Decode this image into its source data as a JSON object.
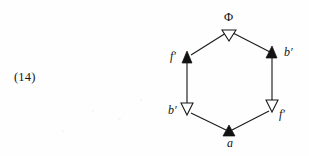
{
  "figure": {
    "kind": "commutative-hexagon-diagram",
    "equation_number": "(14)",
    "background_color": "#fefefe",
    "ink_color": "#121212",
    "vertices": [
      {
        "id": "top",
        "label": "Φ",
        "style": "upright",
        "x": 229,
        "y": 30,
        "label_x": 224,
        "label_y": 11
      },
      {
        "id": "upper-left",
        "label": "f′",
        "style": "italic",
        "x": 187,
        "y": 57,
        "label_x": 170,
        "label_y": 50
      },
      {
        "id": "upper-right",
        "label": "b′",
        "style": "italic",
        "x": 272,
        "y": 53,
        "label_x": 284,
        "label_y": 46
      },
      {
        "id": "lower-left",
        "label": "b′",
        "style": "italic",
        "x": 187,
        "y": 110,
        "label_x": 168,
        "label_y": 104
      },
      {
        "id": "lower-right",
        "label": "f′",
        "style": "italic",
        "x": 272,
        "y": 107,
        "label_x": 279,
        "label_y": 108
      },
      {
        "id": "bottom",
        "label": "a",
        "style": "italic",
        "x": 229,
        "y": 132,
        "label_x": 227,
        "label_y": 137
      }
    ],
    "arrowheads": [
      {
        "id": "arrow-to-phi-top",
        "fill": "hollow",
        "at": "top",
        "direction": "up"
      },
      {
        "id": "arrow-to-upper-left",
        "fill": "solid",
        "at": "upper-left",
        "direction": "up"
      },
      {
        "id": "arrow-to-upper-right",
        "fill": "solid",
        "at": "upper-right",
        "direction": "up"
      },
      {
        "id": "arrow-to-lower-left",
        "fill": "hollow",
        "at": "lower-left",
        "direction": "down"
      },
      {
        "id": "arrow-to-lower-right",
        "fill": "hollow",
        "at": "lower-right",
        "direction": "down"
      },
      {
        "id": "arrow-to-bottom-vertex",
        "fill": "solid",
        "at": "bottom",
        "direction": "up"
      }
    ],
    "edges": [
      {
        "id": "edge-upper-left-to-top",
        "from": "upper-left",
        "to": "top"
      },
      {
        "id": "edge-top-to-upper-right",
        "from": "top",
        "to": "upper-right"
      },
      {
        "id": "edge-lower-left-to-upper-left",
        "from": "lower-left",
        "to": "upper-left"
      },
      {
        "id": "edge-lower-right-to-upper-right",
        "from": "lower-right",
        "to": "upper-right"
      },
      {
        "id": "edge-bottom-to-lower-left",
        "from": "bottom",
        "to": "lower-left"
      },
      {
        "id": "edge-bottom-to-lower-right",
        "from": "bottom",
        "to": "lower-right"
      }
    ]
  }
}
